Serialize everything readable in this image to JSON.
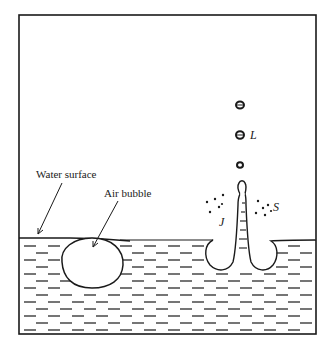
{
  "diagram": {
    "labels": {
      "water_surface": "Water surface",
      "air_bubble": "Air bubble",
      "jet": "J",
      "droplets": "L",
      "spray": "S"
    },
    "colors": {
      "ink": "#1a1a1a",
      "background": "#ffffff"
    }
  }
}
